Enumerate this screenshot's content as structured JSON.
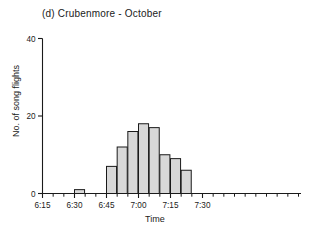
{
  "chart_data": {
    "type": "bar",
    "title": "(d)  Crubenmore - October",
    "xlabel": "Time",
    "ylabel": "No. of song flights",
    "categories": [
      "6:15",
      "6:20",
      "6:25",
      "6:30",
      "6:35",
      "6:40",
      "6:45",
      "6:50",
      "6:55",
      "7:00",
      "7:05",
      "7:10",
      "7:15",
      "7:20",
      "7:25",
      "7:30",
      "7:35",
      "7:40",
      "7:45",
      "7:50",
      "7:55",
      "8:00"
    ],
    "values": [
      0,
      0,
      0,
      1,
      0,
      0,
      7,
      12,
      16,
      18,
      17,
      10,
      9,
      6,
      0,
      0,
      0,
      0,
      0,
      0,
      0,
      0
    ],
    "bars": [
      {
        "time": "6:30",
        "value": 1
      },
      {
        "time": "6:45",
        "value": 7
      },
      {
        "time": "6:50",
        "value": 12
      },
      {
        "time": "6:55",
        "value": 16
      },
      {
        "time": "7:00",
        "value": 18
      },
      {
        "time": "7:05",
        "value": 17
      },
      {
        "time": "7:10",
        "value": 10
      },
      {
        "time": "7:15",
        "value": 9
      },
      {
        "time": "7:20",
        "value": 6
      }
    ],
    "ylim": [
      0,
      40
    ],
    "yticks": [
      0,
      20,
      40
    ],
    "ytick_labels": [
      "0",
      "20",
      "40"
    ],
    "xtick_labels": [
      "6:15",
      "6:30",
      "6:45",
      "7:00",
      "7:15",
      "7:30"
    ],
    "xtick_values": [
      "6:15",
      "6:30",
      "6:45",
      "7:00",
      "7:15",
      "7:30"
    ],
    "minor_tick_interval_minutes": 5,
    "bin_width_minutes": 5,
    "grid": false,
    "legend": false,
    "bar_fill": "#d8d8d8",
    "bar_edge": "#1a1a1a",
    "axis_color": "#1a1a1a"
  }
}
